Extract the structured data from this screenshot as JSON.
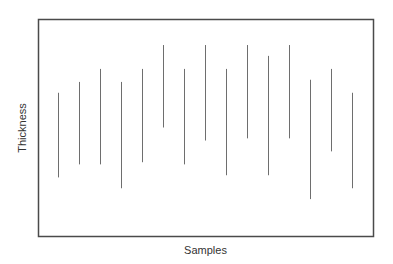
{
  "chart_data": {
    "type": "range-bar",
    "title": "",
    "xlabel": "Samples",
    "ylabel": "Thickness",
    "grid": false,
    "legend": null,
    "axis_ticks": false,
    "note": "Vertical range lines (min-max) per sample; no tick labels shown. Values are in relative units (0 = bottom of frame, 100 = top of frame).",
    "ylim": [
      0,
      100
    ],
    "categories": [
      "1",
      "2",
      "3",
      "4",
      "5",
      "6",
      "7",
      "8",
      "9",
      "10",
      "11",
      "12",
      "13",
      "14",
      "15"
    ],
    "series": [
      {
        "name": "high",
        "values": [
          66,
          71,
          77,
          71,
          77,
          88,
          77,
          88,
          77,
          88,
          83,
          88,
          72,
          77,
          66
        ]
      },
      {
        "name": "low",
        "values": [
          27,
          33,
          33,
          22,
          34,
          50,
          33,
          44,
          28,
          45,
          28,
          45,
          17,
          39,
          22
        ]
      }
    ],
    "color": "#6e6e6e",
    "frame": {
      "left": 38,
      "top": 19,
      "right": 373,
      "bottom": 236
    }
  }
}
